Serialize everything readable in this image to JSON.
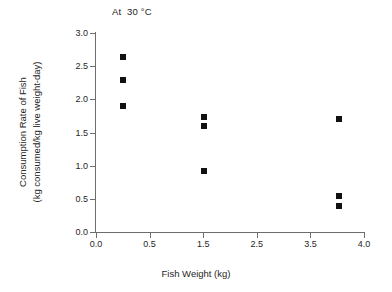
{
  "chart_data": {
    "type": "scatter",
    "title": "At  30 °C",
    "xlabel": "Fish Weight (kg)",
    "ylabel_line1": "Consumption Rate of Fish",
    "ylabel_line2": "(kg consumed/kg live weight-day)",
    "xlim": [
      0.0,
      4.0
    ],
    "ylim": [
      0.0,
      3.0
    ],
    "grid": false,
    "legend": "none",
    "marker_color": "#111111",
    "axis_color": "#6e6e6e",
    "xticks": [
      {
        "label": "0.0",
        "value": 0.0
      },
      {
        "label": "0.5",
        "value": 0.5
      },
      {
        "label": "1.5",
        "value": 1.5
      },
      {
        "label": "2.5",
        "value": 2.5
      },
      {
        "label": "3.5",
        "value": 3.5
      },
      {
        "label": "4.0",
        "value": 4.0
      }
    ],
    "yticks": [
      {
        "label": "0.0",
        "value": 0.0
      },
      {
        "label": "0.5",
        "value": 0.5
      },
      {
        "label": "1.0",
        "value": 1.0
      },
      {
        "label": "1.5",
        "value": 1.5
      },
      {
        "label": "2.0",
        "value": 2.0
      },
      {
        "label": "2.5",
        "value": 2.5
      },
      {
        "label": "3.0",
        "value": 3.0
      }
    ],
    "series": [
      {
        "name": "Consumption rate at 30 C",
        "points": [
          {
            "x": 0.25,
            "y": 2.64
          },
          {
            "x": 0.25,
            "y": 2.29
          },
          {
            "x": 0.25,
            "y": 1.9
          },
          {
            "x": 1.51,
            "y": 1.74
          },
          {
            "x": 1.51,
            "y": 1.6
          },
          {
            "x": 1.51,
            "y": 0.92
          },
          {
            "x": 3.77,
            "y": 1.7
          },
          {
            "x": 3.77,
            "y": 0.55
          },
          {
            "x": 3.77,
            "y": 0.39
          }
        ]
      }
    ]
  }
}
